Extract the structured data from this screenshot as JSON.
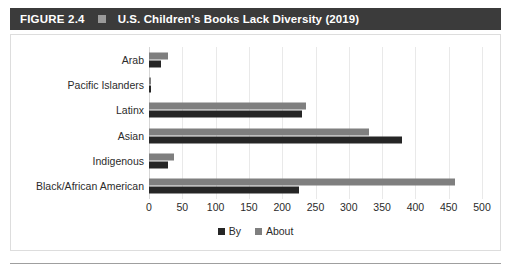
{
  "figure": {
    "number_label": "FIGURE 2.4",
    "separator_icon": "square-icon",
    "title": "U.S. Children's Books Lack Diversity (2019)"
  },
  "colors": {
    "header_background": "#3b3b3b",
    "header_text": "#ffffff",
    "separator_square": "#9a9a9a",
    "series_by": "#262626",
    "series_about": "#7f7f7f",
    "gridline": "#e9e9e9",
    "panel_border": "#dddddd",
    "bottom_rule": "#9f9f9f"
  },
  "chart_data": {
    "type": "bar",
    "orientation": "horizontal",
    "title": "U.S. Children's Books Lack Diversity (2019)",
    "xlabel": "",
    "ylabel": "",
    "xlim": [
      0,
      500
    ],
    "xticks": [
      0,
      50,
      100,
      150,
      200,
      250,
      300,
      350,
      400,
      450,
      500
    ],
    "xtick_labels": [
      "0",
      "50",
      "100",
      "150",
      "200",
      "250",
      "300",
      "350",
      "400",
      "450",
      "500"
    ],
    "grid": true,
    "legend_position": "bottom-center",
    "categories": [
      "Arab",
      "Pacific Islanders",
      "Latinx",
      "Asian",
      "Indigenous",
      "Black/African American"
    ],
    "series": [
      {
        "name": "By",
        "color": "#262626",
        "values": [
          18,
          3,
          230,
          380,
          28,
          225
        ]
      },
      {
        "name": "About",
        "color": "#7f7f7f",
        "values": [
          28,
          2,
          235,
          330,
          38,
          460
        ]
      }
    ]
  }
}
